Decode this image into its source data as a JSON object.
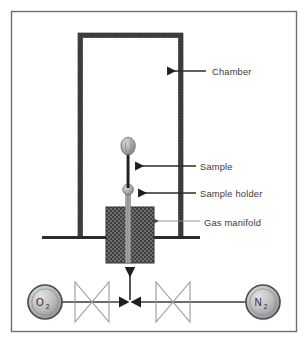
{
  "figure": {
    "background_color": "#ffffff",
    "frame": {
      "name": "outer-frame",
      "x": 11,
      "y": 11,
      "width": 286,
      "height": 321,
      "stroke_color": "#6e6e6e",
      "stroke_width": 1.4
    }
  },
  "diagram": {
    "chamber": {
      "label": "Chamber",
      "x": 78,
      "y": 33,
      "width": 105,
      "height": 204,
      "wall_thickness": 4,
      "wall_color": "#4a4a4a",
      "interior_color": "#ffffff"
    },
    "base_line": {
      "name": "chamber-base-line",
      "x1": 42,
      "x2": 200,
      "y": 237,
      "color": "#2b2b2b",
      "thickness": 3
    },
    "gas_manifold": {
      "label": "Gas manifold",
      "x": 106,
      "y": 207,
      "width": 48,
      "height": 56,
      "fill_color": "#6b6b6b",
      "pattern": "stipple-crosshatch",
      "border_color": "#3a3a3a"
    },
    "sample_holder": {
      "label": "Sample holder",
      "rod_color": "#9a9a9a",
      "bulb_center_x": 128,
      "bulb_center_y": 190,
      "bulb_radius": 5.2
    },
    "sample": {
      "label": "Sample",
      "stem_color": "#2b2b2b",
      "bud_center_x": 128,
      "bud_center_y": 147,
      "bud_fill": "#a8a8a8"
    }
  },
  "labels": [
    {
      "id": "chamber",
      "text": "Chamber",
      "text_x": 212,
      "text_y": 75,
      "leader_x1": 206,
      "leader_x2": 166,
      "leader_y": 71,
      "arrow": "left",
      "color": "#3b3b3b",
      "line_color": "#2b2b2b"
    },
    {
      "id": "sample",
      "text": "Sample",
      "text_x": 200,
      "text_y": 170,
      "leader_x1": 196,
      "leader_x2": 134,
      "leader_y": 166,
      "arrow": "left",
      "color": "#3b3b3b",
      "line_color": "#2b2b2b"
    },
    {
      "id": "sample-holder",
      "text": "Sample holder",
      "text_x": 200,
      "text_y": 197,
      "leader_x1": 196,
      "leader_x2": 137,
      "leader_y": 193,
      "arrow": "left",
      "color": "#3b3b3b",
      "line_color": "#2b2b2b"
    },
    {
      "id": "gas-manifold",
      "text": "Gas manifold",
      "text_x": 204,
      "text_y": 226,
      "leader_x1": 200,
      "leader_x2": 152,
      "leader_y": 221,
      "arrow": "left",
      "color": "#3b3b3b",
      "line_color": "#8a8a8a"
    }
  ],
  "gas_line": {
    "y": 302,
    "junction_x": 130,
    "color": "#3b3b3b",
    "feed_arrow": {
      "name": "manifold-feed-arrow",
      "x": 130,
      "y_from": 300,
      "y_to": 265,
      "direction": "up"
    }
  },
  "cylinders": [
    {
      "id": "o2",
      "formula": "O",
      "subscript": "2",
      "cx": 45,
      "cy": 302,
      "r": 17,
      "fill_light": "#d2d2d2",
      "fill_dark": "#8e8e8e",
      "stroke_color": "#4a4a4a",
      "side": "left"
    },
    {
      "id": "n2",
      "formula": "N",
      "subscript": "2",
      "cx": 263,
      "cy": 302,
      "r": 17,
      "fill_light": "#d2d2d2",
      "fill_dark": "#8e8e8e",
      "stroke_color": "#4a4a4a",
      "side": "right"
    }
  ],
  "valves": [
    {
      "id": "valve-o2",
      "name": "valve-symbol-o2",
      "cx": 92,
      "cy": 302,
      "half_width": 17,
      "half_height": 20,
      "stroke_color": "#9a9a9a"
    },
    {
      "id": "valve-n2",
      "name": "valve-symbol-n2",
      "cx": 173,
      "cy": 302,
      "half_width": 17,
      "half_height": 20,
      "stroke_color": "#9a9a9a"
    }
  ]
}
